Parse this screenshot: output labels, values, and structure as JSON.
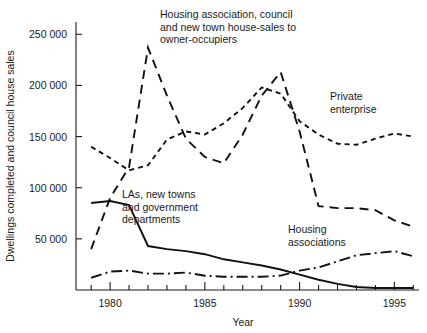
{
  "chart_data": {
    "type": "line",
    "title": "",
    "xlabel": "Year",
    "ylabel": "Dwellings completed and council house sales",
    "xlim": [
      1978.2,
      1996.3
    ],
    "ylim": [
      0,
      262000
    ],
    "grid": false,
    "legend_position": "inline-annotations",
    "x_ticks_major": [
      1980,
      1985,
      1990,
      1995
    ],
    "x_tick_labels": [
      "1980",
      "1985",
      "1990",
      "1995"
    ],
    "x_ticks_minor": [
      1979,
      1981,
      1982,
      1983,
      1984,
      1986,
      1987,
      1988,
      1989,
      1991,
      1992,
      1993,
      1994,
      1996
    ],
    "y_ticks": [
      50000,
      100000,
      150000,
      200000,
      250000
    ],
    "y_tick_labels": [
      "50 000",
      "100 000",
      "150 000",
      "200 000",
      "250 000"
    ],
    "series": [
      {
        "name": "Housing association, council and new town house-sales to owner-occupiers",
        "style": "long-dash",
        "dasharray": "9,6",
        "x": [
          1979,
          1980,
          1981,
          1982,
          1983,
          1984,
          1985,
          1986,
          1987,
          1988,
          1989,
          1990,
          1991,
          1992,
          1993,
          1994,
          1995,
          1996
        ],
        "y": [
          40000,
          90000,
          120000,
          237000,
          190000,
          148000,
          130000,
          124000,
          152000,
          190000,
          213000,
          155000,
          82000,
          80000,
          80000,
          78000,
          68000,
          62000
        ]
      },
      {
        "name": "Private enterprise",
        "style": "short-dash",
        "dasharray": "5,4",
        "x": [
          1979,
          1980,
          1981,
          1982,
          1983,
          1984,
          1985,
          1986,
          1987,
          1988,
          1989,
          1990,
          1991,
          1992,
          1993,
          1994,
          1995,
          1996
        ],
        "y": [
          140000,
          129000,
          117000,
          122000,
          147000,
          155000,
          152000,
          163000,
          178000,
          198000,
          192000,
          165000,
          152000,
          143000,
          142000,
          148000,
          153000,
          150000
        ]
      },
      {
        "name": "LAs, new towns and government departments",
        "style": "solid",
        "dasharray": "none",
        "x": [
          1979,
          1980,
          1981,
          1982,
          1983,
          1984,
          1985,
          1986,
          1987,
          1988,
          1989,
          1990,
          1991,
          1992,
          1993,
          1994,
          1995,
          1996
        ],
        "y": [
          85000,
          87000,
          83000,
          43000,
          40000,
          38000,
          35000,
          30000,
          27000,
          24000,
          20000,
          15000,
          10000,
          6000,
          3000,
          2000,
          2000,
          2000
        ]
      },
      {
        "name": "Housing associations",
        "style": "dash-dot",
        "dasharray": "11,4,2,4",
        "x": [
          1979,
          1980,
          1981,
          1982,
          1983,
          1984,
          1985,
          1986,
          1987,
          1988,
          1989,
          1990,
          1991,
          1992,
          1993,
          1994,
          1995,
          1996
        ],
        "y": [
          12000,
          18000,
          19000,
          16000,
          16000,
          17000,
          14000,
          13000,
          13000,
          13000,
          14000,
          19000,
          22000,
          28000,
          34000,
          36000,
          38000,
          33000
        ]
      }
    ],
    "annotations": [
      {
        "id": "annot-sales",
        "lines": [
          "Housing association, council",
          "and new town house-sales to",
          "owner-occupiers"
        ],
        "x": 160,
        "y": 18
      },
      {
        "id": "annot-private",
        "lines": [
          "Private",
          "enterprise"
        ],
        "x": 330,
        "y": 100
      },
      {
        "id": "annot-las",
        "lines": [
          "LAs, new towns",
          "and government",
          "departments"
        ],
        "x": 122,
        "y": 198
      },
      {
        "id": "annot-ha",
        "lines": [
          "Housing",
          "associations"
        ],
        "x": 288,
        "y": 233
      }
    ],
    "colors": {
      "axis": "#1a1a1a",
      "line": "#111111",
      "background": "#ffffff"
    }
  }
}
